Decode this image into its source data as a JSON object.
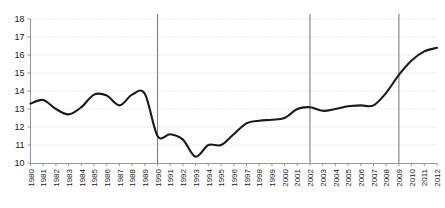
{
  "chart_data": {
    "type": "line",
    "title": "",
    "subtitle": "",
    "xlabel": "",
    "ylabel": "",
    "grid": true,
    "legend": "none",
    "xlim": [
      1980,
      2012
    ],
    "ylim": [
      10,
      18
    ],
    "ytick_values": [
      10,
      11,
      12,
      13,
      14,
      15,
      16,
      17,
      18
    ],
    "ytick_labels": [
      "10",
      "11",
      "12",
      "13",
      "14",
      "15",
      "16",
      "17",
      "18"
    ],
    "categories": [
      "1980",
      "1981",
      "1982",
      "1983",
      "1984",
      "1985",
      "1986",
      "1987",
      "1988",
      "1989",
      "1990",
      "1991",
      "1992",
      "1993",
      "1994",
      "1995",
      "1996",
      "1997",
      "1998",
      "1999",
      "2000",
      "2001",
      "2002",
      "2003",
      "2004",
      "2005",
      "2006",
      "2007",
      "2008",
      "2009",
      "2010",
      "2011",
      "2012"
    ],
    "x": [
      1980,
      1981,
      1982,
      1983,
      1984,
      1985,
      1986,
      1987,
      1988,
      1989,
      1990,
      1991,
      1992,
      1993,
      1994,
      1995,
      1996,
      1997,
      1998,
      1999,
      2000,
      2001,
      2002,
      2003,
      2004,
      2005,
      2006,
      2007,
      2008,
      2009,
      2010,
      2011,
      2012
    ],
    "values": [
      13.3,
      13.5,
      13.0,
      12.7,
      13.1,
      13.8,
      13.75,
      13.2,
      13.8,
      13.85,
      11.5,
      11.6,
      11.3,
      10.35,
      11.0,
      11.0,
      11.6,
      12.2,
      12.35,
      12.4,
      12.5,
      13.0,
      13.1,
      12.9,
      13.0,
      13.15,
      13.2,
      13.2,
      13.9,
      14.9,
      15.7,
      16.2,
      16.4
    ],
    "series": [
      {
        "name": "series-1",
        "color": "#1a1a1a",
        "values": [
          13.3,
          13.5,
          13.0,
          12.7,
          13.1,
          13.8,
          13.75,
          13.2,
          13.8,
          13.85,
          11.5,
          11.6,
          11.3,
          10.35,
          11.0,
          11.0,
          11.6,
          12.2,
          12.35,
          12.4,
          12.5,
          13.0,
          13.1,
          12.9,
          13.0,
          13.15,
          13.2,
          13.2,
          13.9,
          14.9,
          15.7,
          16.2,
          16.4
        ]
      }
    ],
    "annotations": [
      {
        "type": "vertical-line",
        "x": 1990,
        "label": "1990",
        "color": "#7d7d7d"
      },
      {
        "type": "vertical-line",
        "x": 2002,
        "label": "2002",
        "color": "#7d7d7d"
      },
      {
        "type": "vertical-line",
        "x": 2009,
        "label": "2009",
        "color": "#7d7d7d"
      }
    ]
  }
}
